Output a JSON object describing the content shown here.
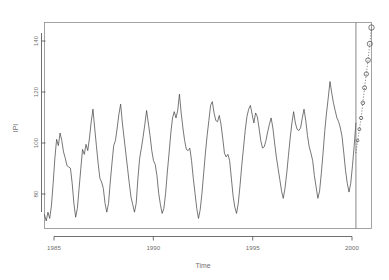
{
  "chart_data": {
    "type": "line",
    "title": "",
    "xlabel": "Time",
    "ylabel": "IPI",
    "xlim": [
      1985.0,
      2000.75
    ],
    "ylim": [
      68,
      150
    ],
    "xticks": [
      1985,
      1990,
      1995,
      2000
    ],
    "xticklabels": [
      "1985",
      "1990",
      "1995",
      "2000"
    ],
    "yticks": [
      80,
      100,
      120,
      140
    ],
    "yticklabels": [
      "80",
      "100",
      "120",
      "140"
    ],
    "grid": false,
    "legend": null,
    "annotations": [
      {
        "name": "forecast-origin-line",
        "type": "vline",
        "x": 2000.0
      }
    ],
    "series": [
      {
        "name": "IPI observed",
        "style": "solid-line",
        "x": [
          1985.0,
          1985.0833,
          1985.1667,
          1985.25,
          1985.3333,
          1985.4167,
          1985.5,
          1985.5833,
          1985.6667,
          1985.75,
          1985.8333,
          1985.9167,
          1986.0,
          1986.0833,
          1986.1667,
          1986.25,
          1986.3333,
          1986.4167,
          1986.5,
          1986.5833,
          1986.6667,
          1986.75,
          1986.8333,
          1986.9167,
          1987.0,
          1987.0833,
          1987.1667,
          1987.25,
          1987.3333,
          1987.4167,
          1987.5,
          1987.5833,
          1987.6667,
          1987.75,
          1987.8333,
          1987.9167,
          1988.0,
          1988.0833,
          1988.1667,
          1988.25,
          1988.3333,
          1988.4167,
          1988.5,
          1988.5833,
          1988.6667,
          1988.75,
          1988.8333,
          1988.9167,
          1989.0,
          1989.0833,
          1989.1667,
          1989.25,
          1989.3333,
          1989.4167,
          1989.5,
          1989.5833,
          1989.6667,
          1989.75,
          1989.8333,
          1989.9167,
          1990.0,
          1990.0833,
          1990.1667,
          1990.25,
          1990.3333,
          1990.4167,
          1990.5,
          1990.5833,
          1990.6667,
          1990.75,
          1990.8333,
          1990.9167,
          1991.0,
          1991.0833,
          1991.1667,
          1991.25,
          1991.3333,
          1991.4167,
          1991.5,
          1991.5833,
          1991.6667,
          1991.75,
          1991.8333,
          1991.9167,
          1992.0,
          1992.0833,
          1992.1667,
          1992.25,
          1992.3333,
          1992.4167,
          1992.5,
          1992.5833,
          1992.6667,
          1992.75,
          1992.8333,
          1992.9167,
          1993.0,
          1993.0833,
          1993.1667,
          1993.25,
          1993.3333,
          1993.4167,
          1993.5,
          1993.5833,
          1993.6667,
          1993.75,
          1993.8333,
          1993.9167,
          1994.0,
          1994.0833,
          1994.1667,
          1994.25,
          1994.3333,
          1994.4167,
          1994.5,
          1994.5833,
          1994.6667,
          1994.75,
          1994.8333,
          1994.9167,
          1995.0,
          1995.0833,
          1995.1667,
          1995.25,
          1995.3333,
          1995.4167,
          1995.5,
          1995.5833,
          1995.6667,
          1995.75,
          1995.8333,
          1995.9167,
          1996.0,
          1996.0833,
          1996.1667,
          1996.25,
          1996.3333,
          1996.4167,
          1996.5,
          1996.5833,
          1996.6667,
          1996.75,
          1996.8333,
          1996.9167,
          1997.0,
          1997.0833,
          1997.1667,
          1997.25,
          1997.3333,
          1997.4167,
          1997.5,
          1997.5833,
          1997.6667,
          1997.75,
          1997.8333,
          1997.9167,
          1998.0,
          1998.0833,
          1998.1667,
          1998.25,
          1998.3333,
          1998.4167,
          1998.5,
          1998.5833,
          1998.6667,
          1998.75,
          1998.8333,
          1998.9167,
          1999.0,
          1999.0833,
          1999.1667,
          1999.25,
          1999.3333,
          1999.4167,
          1999.5,
          1999.5833,
          1999.6667,
          1999.75,
          1999.8333,
          1999.9167,
          2000.0
        ],
        "values": [
          73.5,
          71.0,
          74.5,
          72.0,
          77.0,
          86.0,
          96.0,
          103.5,
          101.0,
          106.0,
          103.0,
          98.5,
          96.0,
          93.0,
          92.5,
          92.0,
          86.0,
          78.0,
          72.5,
          76.0,
          84.0,
          92.0,
          99.5,
          97.5,
          101.5,
          99.0,
          104.0,
          110.5,
          115.5,
          108.0,
          101.0,
          94.0,
          88.0,
          86.5,
          84.0,
          78.0,
          74.5,
          78.0,
          86.5,
          94.0,
          101.0,
          103.0,
          108.0,
          113.5,
          117.5,
          110.0,
          104.0,
          98.0,
          92.0,
          86.0,
          80.5,
          77.5,
          74.5,
          78.0,
          88.0,
          96.0,
          100.0,
          104.5,
          109.5,
          115.0,
          110.0,
          105.0,
          99.0,
          95.0,
          93.5,
          89.0,
          82.0,
          77.5,
          74.0,
          76.0,
          82.0,
          90.5,
          98.0,
          106.0,
          112.0,
          114.5,
          112.0,
          115.0,
          121.5,
          114.0,
          108.0,
          103.0,
          99.5,
          99.0,
          100.0,
          95.0,
          88.0,
          82.0,
          76.0,
          72.0,
          75.5,
          82.0,
          90.0,
          98.0,
          105.0,
          111.0,
          117.0,
          118.5,
          114.0,
          111.0,
          110.5,
          113.0,
          109.5,
          104.0,
          98.0,
          96.5,
          97.5,
          95.0,
          88.0,
          81.0,
          76.5,
          74.0,
          78.0,
          85.0,
          93.0,
          100.0,
          107.0,
          112.5,
          115.5,
          117.0,
          113.5,
          110.0,
          114.0,
          112.5,
          108.0,
          103.0,
          100.0,
          100.5,
          103.0,
          106.5,
          109.5,
          112.0,
          108.0,
          102.0,
          96.5,
          92.0,
          87.5,
          83.0,
          80.0,
          84.0,
          90.0,
          97.0,
          104.0,
          110.0,
          114.5,
          110.0,
          107.5,
          107.0,
          108.0,
          112.0,
          115.5,
          111.0,
          105.0,
          100.5,
          98.0,
          95.0,
          89.0,
          84.5,
          80.0,
          83.0,
          90.0,
          98.0,
          107.0,
          114.0,
          120.0,
          126.5,
          122.0,
          118.0,
          115.0,
          112.0,
          110.5,
          108.0,
          104.5,
          98.0,
          91.0,
          86.0,
          82.5,
          86.0,
          93.0,
          101.0,
          110.0
        ]
      },
      {
        "name": "IPI observed (continued)",
        "style": "solid-line",
        "comment": "later-cycle detail appended in main trace"
      }
    ],
    "forecast": {
      "name": "IPI forecast",
      "style": "dotted-line-open-circles",
      "marker": "open-circle",
      "x": [
        2000.0,
        2000.0833,
        2000.1667,
        2000.25,
        2000.3333,
        2000.4167,
        2000.5,
        2000.5833,
        2000.6667,
        2000.75
      ],
      "values": [
        98.0,
        103.0,
        107.5,
        112.0,
        118.0,
        124.0,
        129.5,
        135.0,
        141.5,
        148.0
      ]
    }
  },
  "axes": {
    "ylabel": "IPI",
    "xlabel": "Time"
  }
}
